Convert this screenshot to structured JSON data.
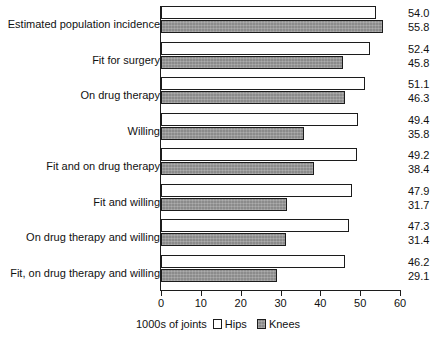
{
  "chart_data": {
    "type": "bar",
    "orientation": "horizontal",
    "title": "",
    "xlabel": "1000s of joints",
    "ylabel": "",
    "xlim": [
      0,
      60
    ],
    "xticks": [
      0,
      10,
      20,
      30,
      40,
      50,
      60
    ],
    "grid": false,
    "legend_position": "bottom",
    "categories": [
      "Estimated population incidence",
      "Fit for surgery",
      "On drug therapy",
      "Willing",
      "Fit and on drug therapy",
      "Fit and willing",
      "On drug therapy and willing",
      "Fit, on drug therapy and willing"
    ],
    "series": [
      {
        "name": "Hips",
        "color": "#ffffff",
        "values": [
          54.0,
          52.4,
          51.1,
          49.4,
          49.2,
          47.9,
          47.3,
          46.2
        ]
      },
      {
        "name": "Knees",
        "color": "#8b8b8b",
        "values": [
          55.8,
          45.8,
          46.3,
          35.8,
          38.4,
          31.7,
          31.4,
          29.1
        ]
      }
    ],
    "value_labels": [
      {
        "hips": "54.0",
        "knees": "55.8"
      },
      {
        "hips": "52.4",
        "knees": "45.8"
      },
      {
        "hips": "51.1",
        "knees": "46.3"
      },
      {
        "hips": "49.4",
        "knees": "35.8"
      },
      {
        "hips": "49.2",
        "knees": "38.4"
      },
      {
        "hips": "47.9",
        "knees": "31.7"
      },
      {
        "hips": "47.3",
        "knees": "31.4"
      },
      {
        "hips": "46.2",
        "knees": "29.1"
      }
    ]
  },
  "axis": {
    "tick_labels": [
      "0",
      "10",
      "20",
      "30",
      "40",
      "50",
      "60"
    ]
  },
  "legend": {
    "unit_label": "1000s of joints",
    "entries": [
      {
        "label": "Hips",
        "swatch": "hips"
      },
      {
        "label": "Knees",
        "swatch": "knees"
      }
    ]
  }
}
